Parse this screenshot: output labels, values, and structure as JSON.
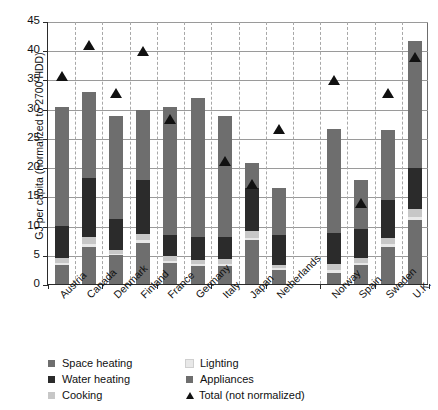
{
  "chart_data": {
    "type": "bar",
    "stacked": true,
    "title": "",
    "xlabel": "",
    "ylabel": "GJ per capita (normalized to 2700 HDD)",
    "ylim": [
      0,
      45
    ],
    "yticks": [
      0,
      5,
      10,
      15,
      20,
      25,
      30,
      35,
      40,
      45
    ],
    "grid": true,
    "legend_position": "below-axes",
    "categories": [
      "Austria",
      "Canada",
      "Denmark",
      "Finland",
      "France",
      "Germany",
      "Italy",
      "Japan",
      "Netherlands",
      "Norway",
      "Spain",
      "Sweden",
      "U.K."
    ],
    "series": [
      {
        "name": "Space heating",
        "color": "#6e6e6e",
        "values": [
          20.4,
          14.6,
          17.5,
          11.9,
          21.9,
          23.9,
          20.6,
          4.3,
          8.1,
          17.8,
          8.4,
          12.0,
          21.7
        ]
      },
      {
        "name": "Water heating",
        "color": "#2b2b2b",
        "values": [
          5.4,
          10.2,
          5.3,
          9.2,
          3.6,
          3.9,
          3.8,
          7.3,
          5.1,
          5.2,
          5.0,
          6.6,
          6.9
        ]
      },
      {
        "name": "Cooking",
        "color": "#c7c7c7",
        "values": [
          0.9,
          1.2,
          0.7,
          1.1,
          0.8,
          0.7,
          0.8,
          1.2,
          0.6,
          1.1,
          0.8,
          1.0,
          1.5
        ]
      },
      {
        "name": "Lighting",
        "color": "#e8e8e8",
        "values": [
          0.4,
          0.5,
          0.3,
          0.4,
          0.4,
          0.4,
          0.4,
          0.4,
          0.3,
          0.5,
          0.3,
          0.4,
          0.5
        ]
      },
      {
        "name": "Appliances",
        "color": "#6e6e6e",
        "values": [
          3.2,
          6.3,
          4.9,
          7.1,
          3.6,
          3.0,
          3.1,
          7.5,
          2.4,
          1.9,
          3.3,
          6.4,
          10.9
        ]
      }
    ],
    "totals_stacked": [
      30.3,
      32.8,
      28.7,
      29.7,
      30.3,
      31.9,
      28.7,
      20.7,
      16.5,
      26.5,
      17.8,
      26.4,
      41.5
    ],
    "marker_series": {
      "name": "Total (not normalized)",
      "color": "#111111",
      "marker": "triangle",
      "values": [
        35.8,
        41.1,
        32.8,
        40.0,
        28.4,
        null,
        21.3,
        17.2,
        26.7,
        35.0,
        14.1,
        32.9,
        39.0
      ]
    }
  },
  "legend": {
    "items": [
      {
        "label": "Space heating",
        "color": "#6e6e6e",
        "shape": "square",
        "column": "left"
      },
      {
        "label": "Water heating",
        "color": "#2b2b2b",
        "shape": "square",
        "column": "left"
      },
      {
        "label": "Cooking",
        "color": "#c7c7c7",
        "shape": "square",
        "column": "left"
      },
      {
        "label": "Lighting",
        "color": "#e8e8e8",
        "shape": "square",
        "column": "right"
      },
      {
        "label": "Appliances",
        "color": "#6e6e6e",
        "shape": "square",
        "column": "right"
      },
      {
        "label": "Total (not normalized)",
        "color": "#111111",
        "shape": "triangle",
        "column": "right"
      }
    ]
  },
  "axes": {
    "y_title": "GJ per capita (normalized to 2700 HDD)",
    "y_tick_labels": [
      "0",
      "5",
      "10",
      "15",
      "20",
      "25",
      "30",
      "35",
      "40",
      "45"
    ]
  }
}
